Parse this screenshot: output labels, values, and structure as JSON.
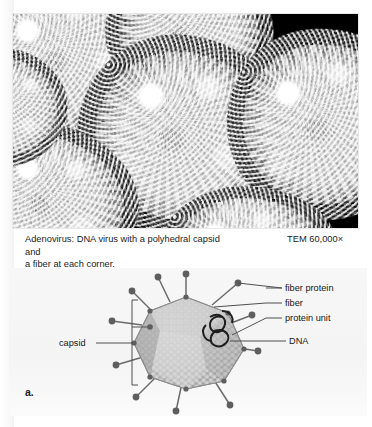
{
  "figure": {
    "panel_letter": "a.",
    "caption": {
      "line1": "Adenovirus: DNA virus with a polyhedral capsid and",
      "line2": "a fiber at each corner.",
      "full": "Adenovirus: DNA virus with a polyhedral capsid and a fiber at each corner."
    },
    "magnification_note": "TEM 60,000×"
  },
  "micrograph": {
    "technique": "TEM",
    "magnification": "60,000×",
    "subject": "adenovirus particles",
    "background_color": "#000000",
    "particle_color": "#dedede",
    "particles": [
      {
        "name": "particle-top-left",
        "cx": 52,
        "cy": 42,
        "rx": 78,
        "ry": 74,
        "rot": -12
      },
      {
        "name": "particle-top-center",
        "cx": 176,
        "cy": 20,
        "rx": 70,
        "ry": 62,
        "rot": 8
      },
      {
        "name": "particle-center",
        "cx": 170,
        "cy": 122,
        "rx": 88,
        "ry": 84,
        "rot": 5
      },
      {
        "name": "particle-right",
        "cx": 312,
        "cy": 110,
        "rx": 82,
        "ry": 80,
        "rot": -7
      },
      {
        "name": "particle-bottom-left",
        "cx": 36,
        "cy": 190,
        "rx": 74,
        "ry": 66,
        "rot": 14
      },
      {
        "name": "particle-bottom-center",
        "cx": 196,
        "cy": 214,
        "rx": 76,
        "ry": 60,
        "rot": -4
      }
    ]
  },
  "diagram": {
    "capsid_color": "#b6b6b6",
    "capsid_highlight_color": "#d2d2d2",
    "capsid_shadow_color": "#9a9a9a",
    "fiber_color": "#6f6f6f",
    "knob_color": "#5e5e5e",
    "dna_color": "#1a1a1a",
    "leader_color": "#555555",
    "labels": [
      {
        "id": "fiber-protein",
        "text": "fiber protein"
      },
      {
        "id": "fiber",
        "text": "fiber"
      },
      {
        "id": "protein-unit",
        "text": "protein unit"
      },
      {
        "id": "dna",
        "text": "DNA"
      },
      {
        "id": "capsid",
        "text": "capsid"
      }
    ]
  }
}
